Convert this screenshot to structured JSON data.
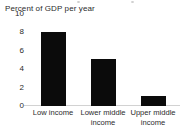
{
  "chart_data": {
    "type": "bar",
    "title": "Percent of GDP per year",
    "xlabel": "",
    "ylabel": "Percent of GDP per year",
    "categories": [
      "Low income",
      "Lower middle income",
      "Upper middle income"
    ],
    "values": [
      8.0,
      5.1,
      1.1
    ],
    "ylim": [
      0,
      10
    ],
    "yticks": [
      10,
      8,
      6,
      4,
      2,
      0
    ],
    "ytick_labels": [
      "10",
      "8",
      "6",
      "4",
      "2",
      "0"
    ],
    "grid": false,
    "legend": null,
    "bar_color": "#0b0b0b",
    "axis_color": "#d2d2d2",
    "text_color": "#2b2b2b"
  },
  "category_lines": [
    [
      "Low income"
    ],
    [
      "Lower middle",
      "income"
    ],
    [
      "Upper middle",
      "income"
    ]
  ]
}
